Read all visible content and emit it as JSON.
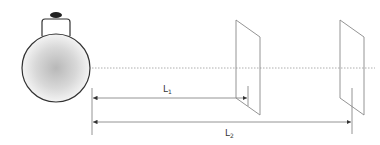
{
  "diagram": {
    "labels": {
      "L1": {
        "main": "L",
        "sub": "1"
      },
      "L2": {
        "main": "L",
        "sub": "2"
      }
    },
    "components": [
      "light-bulb",
      "optical-axis",
      "screen-1",
      "screen-2",
      "distance-L1",
      "distance-L2"
    ],
    "colors": {
      "line": "#888888",
      "bulb_outline": "#333333",
      "bulb_fill_center": "#bbbbbb"
    }
  }
}
